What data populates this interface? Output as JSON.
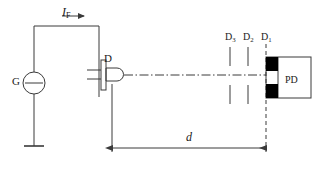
{
  "figure": {
    "type": "schematic-diagram",
    "stroke_color": "#3a3a3a",
    "fill_black": "#000000",
    "background": "#ffffff"
  },
  "labels": {
    "forward_current": {
      "symbol": "I",
      "subscript": "F",
      "name": "forward-current"
    },
    "generator": {
      "text": "G",
      "name": "generator"
    },
    "led": {
      "text": "D",
      "name": "led-diode"
    },
    "aperture_3": {
      "symbol": "D",
      "subscript": "3"
    },
    "aperture_2": {
      "symbol": "D",
      "subscript": "2"
    },
    "aperture_1": {
      "symbol": "D",
      "subscript": "1"
    },
    "photodetector": {
      "text": "PD",
      "name": "photodetector"
    },
    "distance": {
      "text": "d",
      "name": "distance-d"
    }
  },
  "components": {
    "generator_symbol": "circle-with-horizontal-bar",
    "ground_symbol": "ground-bar",
    "led_symbol": "led-package-with-dome-lens",
    "optical_axis": "dash-dot-centerline",
    "dimension_line": "double-headed-arrow"
  }
}
